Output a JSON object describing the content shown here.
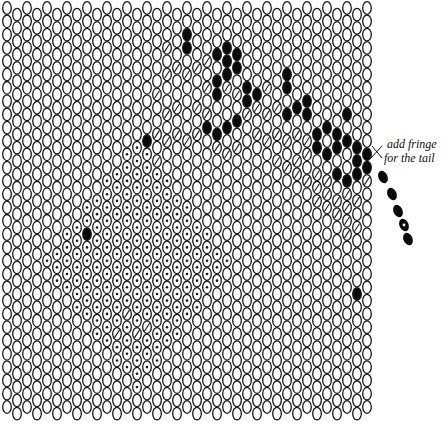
{
  "legend_types": {
    "O": "empty bead",
    "H": "hatched bead",
    "D": "dotted bead",
    "B": "black bead"
  },
  "colors": {
    "outline": "#1a1a1a",
    "fill_black": "#0a0a0a",
    "background": "#ffffff"
  },
  "grid": {
    "columns": 37,
    "rows": 31
  },
  "annotation": {
    "line1": "add fringe",
    "line2": "for the tail"
  },
  "black_beads": [
    [
      18,
      2
    ],
    [
      18,
      3
    ],
    [
      21,
      3
    ],
    [
      22,
      3
    ],
    [
      23,
      3
    ],
    [
      22,
      4
    ],
    [
      23,
      4
    ],
    [
      21,
      5
    ],
    [
      22,
      5
    ],
    [
      21,
      6
    ],
    [
      24,
      6
    ],
    [
      25,
      6
    ],
    [
      24,
      7
    ],
    [
      28,
      5
    ],
    [
      28,
      6
    ],
    [
      29,
      7
    ],
    [
      30,
      7
    ],
    [
      30,
      8
    ],
    [
      28,
      8
    ],
    [
      31,
      9
    ],
    [
      32,
      9
    ],
    [
      33,
      9
    ],
    [
      34,
      8
    ],
    [
      34,
      10
    ],
    [
      35,
      10
    ],
    [
      33,
      10
    ],
    [
      35,
      11
    ],
    [
      35,
      12
    ],
    [
      36,
      11
    ],
    [
      36,
      12
    ],
    [
      31,
      10
    ],
    [
      32,
      11
    ],
    [
      33,
      12
    ],
    [
      34,
      13
    ],
    [
      14,
      10
    ],
    [
      20,
      9
    ],
    [
      21,
      9
    ],
    [
      22,
      9
    ],
    [
      23,
      8
    ],
    [
      8,
      17
    ],
    [
      35,
      21
    ]
  ],
  "hatched_beads": [
    [
      16,
      3
    ],
    [
      17,
      4
    ],
    [
      16,
      5
    ],
    [
      15,
      6
    ],
    [
      17,
      7
    ],
    [
      18,
      5
    ],
    [
      19,
      4
    ],
    [
      20,
      4
    ],
    [
      20,
      6
    ],
    [
      19,
      7
    ],
    [
      20,
      8
    ],
    [
      17,
      9
    ],
    [
      18,
      10
    ],
    [
      15,
      11
    ],
    [
      16,
      10
    ],
    [
      22,
      6
    ],
    [
      23,
      6
    ],
    [
      25,
      7
    ],
    [
      26,
      8
    ],
    [
      27,
      7
    ],
    [
      26,
      6
    ],
    [
      27,
      9
    ],
    [
      28,
      10
    ],
    [
      29,
      9
    ],
    [
      29,
      11
    ],
    [
      30,
      11
    ],
    [
      31,
      12
    ],
    [
      30,
      10
    ],
    [
      29,
      12
    ],
    [
      30,
      13
    ],
    [
      31,
      14
    ],
    [
      32,
      13
    ],
    [
      32,
      14
    ],
    [
      33,
      15
    ],
    [
      34,
      14
    ],
    [
      34,
      15
    ],
    [
      33,
      14
    ],
    [
      35,
      14
    ],
    [
      35,
      16
    ],
    [
      34,
      16
    ],
    [
      36,
      13
    ],
    [
      32,
      15
    ],
    [
      31,
      13
    ],
    [
      24,
      8
    ],
    [
      25,
      9
    ],
    [
      26,
      10
    ],
    [
      27,
      11
    ],
    [
      28,
      12
    ],
    [
      16,
      8
    ],
    [
      15,
      9
    ],
    [
      21,
      10
    ],
    [
      19,
      9
    ],
    [
      23,
      10
    ],
    [
      22,
      11
    ],
    [
      34,
      17
    ],
    [
      12,
      23
    ],
    [
      13,
      24
    ],
    [
      11,
      24
    ],
    [
      14,
      24
    ]
  ],
  "dotted_region": {
    "description": "large diamond-shaped region of dotted beads in lower-left/center",
    "beads": []
  },
  "fringe": {
    "beads": [
      {
        "type": "B"
      },
      {
        "type": "B"
      },
      {
        "type": "B"
      },
      {
        "type": "D"
      },
      {
        "type": "B"
      }
    ]
  }
}
